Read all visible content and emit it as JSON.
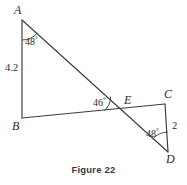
{
  "figure": {
    "caption": "Figure 22",
    "cropped_header_text": "",
    "vertices": [
      {
        "id": "A",
        "label": "A",
        "x": 22,
        "y": 20
      },
      {
        "id": "B",
        "label": "B",
        "x": 22,
        "y": 118
      },
      {
        "id": "C",
        "label": "C",
        "x": 165,
        "y": 104
      },
      {
        "id": "D",
        "label": "D",
        "x": 168,
        "y": 152
      },
      {
        "id": "E",
        "label": "E",
        "x": 122,
        "y": 109
      }
    ],
    "segments": [
      {
        "name": "AB",
        "from": "A",
        "to": "B"
      },
      {
        "name": "AD",
        "from": "A",
        "to": "D"
      },
      {
        "name": "BC",
        "from": "B",
        "to": "C"
      },
      {
        "name": "CD",
        "from": "C",
        "to": "D"
      }
    ],
    "angle_marks": [
      {
        "name": "angle-at-A",
        "value": "48",
        "unit": "°",
        "at": "A"
      },
      {
        "name": "angle-at-E",
        "value": "46",
        "unit": "°",
        "at": "E"
      },
      {
        "name": "angle-at-D",
        "value": "48",
        "unit": "°",
        "at": "D"
      }
    ],
    "side_labels": [
      {
        "name": "side-AB-length",
        "value": "4.2",
        "on": "AB"
      },
      {
        "name": "side-CD-length",
        "value": "2",
        "on": "CD"
      }
    ],
    "colors": {
      "stroke": "#3c3c3c",
      "text": "#2b2b2b",
      "caption": "#3a3a3a",
      "background": "#ffffff"
    }
  }
}
